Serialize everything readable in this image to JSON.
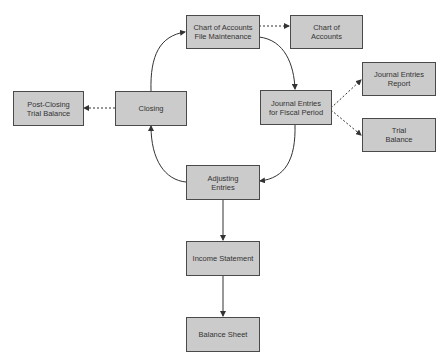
{
  "diagram": {
    "nodes": [
      {
        "id": "coa_maint",
        "label": "Chart of Accounts\nFile Maintenance"
      },
      {
        "id": "coa",
        "label": "Chart of\nAccounts"
      },
      {
        "id": "closing",
        "label": "Closing"
      },
      {
        "id": "post_closing",
        "label": "Post-Closing\nTrial Balance"
      },
      {
        "id": "journal_entries",
        "label": "Journal Entries\nfor Fiscal Period"
      },
      {
        "id": "je_report",
        "label": "Journal Entries\nReport"
      },
      {
        "id": "trial_balance",
        "label": "Trial\nBalance"
      },
      {
        "id": "adjusting",
        "label": "Adjusting\nEntries"
      },
      {
        "id": "income_statement",
        "label": "Income Statement"
      },
      {
        "id": "balance_sheet",
        "label": "Balance Sheet"
      }
    ],
    "edges": [
      {
        "from": "coa_maint",
        "to": "coa",
        "style": "dashed"
      },
      {
        "from": "coa_maint",
        "to": "journal_entries",
        "style": "solid-curved"
      },
      {
        "from": "journal_entries",
        "to": "je_report",
        "style": "dashed"
      },
      {
        "from": "journal_entries",
        "to": "trial_balance",
        "style": "dashed"
      },
      {
        "from": "journal_entries",
        "to": "adjusting",
        "style": "solid-curved"
      },
      {
        "from": "adjusting",
        "to": "closing",
        "style": "solid-curved"
      },
      {
        "from": "closing",
        "to": "coa_maint",
        "style": "solid-curved"
      },
      {
        "from": "closing",
        "to": "post_closing",
        "style": "dashed"
      },
      {
        "from": "adjusting",
        "to": "income_statement",
        "style": "solid"
      },
      {
        "from": "income_statement",
        "to": "balance_sheet",
        "style": "solid"
      }
    ],
    "colors": {
      "node_fill": "#cbcbcb",
      "node_border": "#4a4a4a",
      "line": "#333333",
      "text": "#333333"
    }
  }
}
